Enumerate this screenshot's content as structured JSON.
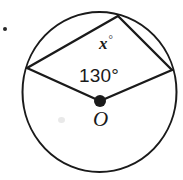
{
  "figure": {
    "background_color": "#ffffff",
    "stroke_color": "#1a1a1a",
    "labels": {
      "unknown_angle": "x",
      "unknown_angle_degree_symbol": "°",
      "central_angle": "130°",
      "center_point": "O"
    },
    "circle": {
      "center_x": 99.5,
      "center_y": 92,
      "radius_x": 77,
      "radius_y": 80,
      "stroke_width": 2
    },
    "points": {
      "center": {
        "x": 100,
        "y": 101,
        "dot_radius": 6
      },
      "left_vertex": {
        "x": 27,
        "y": 68
      },
      "top_vertex": {
        "x": 118,
        "y": 16
      },
      "right_vertex": {
        "x": 172,
        "y": 70
      }
    },
    "segments": [
      {
        "name": "chord-left-top",
        "from": "left_vertex",
        "to": "top_vertex"
      },
      {
        "name": "chord-top-right",
        "from": "top_vertex",
        "to": "right_vertex"
      },
      {
        "name": "radius-center-left",
        "from": "center",
        "to": "left_vertex"
      },
      {
        "name": "radius-center-right",
        "from": "center",
        "to": "right_vertex"
      }
    ],
    "artifacts": {
      "bullet_mark": {
        "x": 3,
        "y": 27
      },
      "scan_smudge": {
        "x": 58,
        "y": 117
      }
    }
  }
}
